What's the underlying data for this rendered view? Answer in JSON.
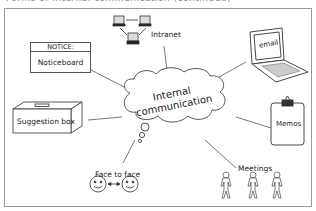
{
  "caption_partial": "Forms of internal communication (continued)",
  "center": {
    "line1": "Internal",
    "line2": "communication"
  },
  "nodes": {
    "intranet": {
      "label": "Intranet",
      "icon": "network-computers-icon"
    },
    "email": {
      "label": "email",
      "icon": "laptop-icon"
    },
    "memos": {
      "label": "Memos",
      "icon": "clipboard-icon"
    },
    "meetings": {
      "label": "Meetings",
      "icon": "stick-figures-icon"
    },
    "face_to_face": {
      "label": "Face to face",
      "icon": "smiley-faces-icon"
    },
    "suggestion_box": {
      "label": "Suggestion box",
      "icon": "box-icon"
    },
    "noticeboard": {
      "header": "NOTICE:",
      "label": "Noticeboard",
      "icon": "noticeboard-icon"
    }
  },
  "colors": {
    "line": "#555555",
    "frame": "#999999",
    "text": "#222222"
  }
}
